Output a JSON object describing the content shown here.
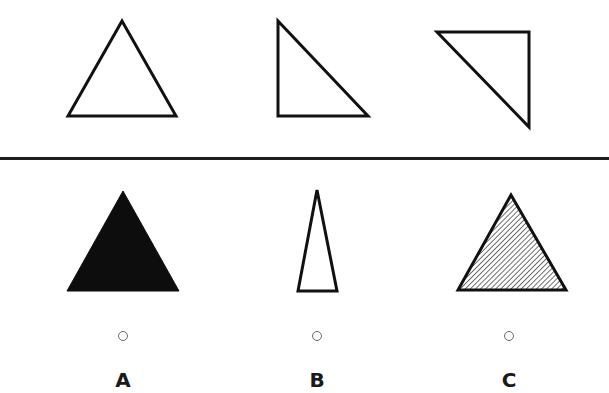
{
  "question": {
    "description": "Sequence of three triangles (top row) followed by three answer options (bottom row)",
    "sequence": [
      {
        "id": "seq-1",
        "shape": "isosceles-triangle",
        "fill": "none",
        "orientation": "apex-up"
      },
      {
        "id": "seq-2",
        "shape": "right-triangle",
        "fill": "none",
        "orientation": "right-angle-bottom-left"
      },
      {
        "id": "seq-3",
        "shape": "right-triangle",
        "fill": "none",
        "orientation": "right-angle-top-right"
      }
    ]
  },
  "options": [
    {
      "key": "A",
      "label": "A",
      "shape": "isosceles-triangle",
      "fill": "solid-black",
      "selected": false
    },
    {
      "key": "B",
      "label": "B",
      "shape": "narrow-isosceles-triangle",
      "fill": "none",
      "selected": false
    },
    {
      "key": "C",
      "label": "C",
      "shape": "isosceles-triangle",
      "fill": "diagonal-hatch",
      "selected": false
    }
  ],
  "colors": {
    "stroke": "#111111",
    "divider": "#1e1e1e",
    "radio_border": "#6a6a6a",
    "label": "#1a1a1a",
    "background": "#ffffff"
  }
}
